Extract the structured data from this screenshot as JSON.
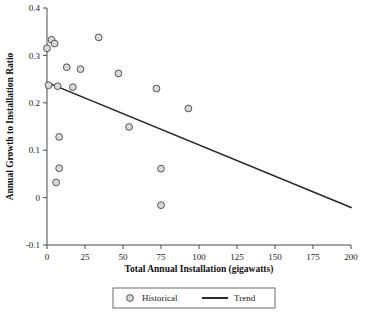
{
  "chart_data": {
    "type": "scatter",
    "title": "",
    "xlabel": "Total Annual Installation (gigawatts)",
    "ylabel": "Annual Growth to Installation Ratio",
    "xlim": [
      0,
      200
    ],
    "ylim": [
      -0.1,
      0.4
    ],
    "xticks": [
      0,
      25,
      50,
      75,
      100,
      125,
      150,
      175,
      200
    ],
    "xticklabels": [
      "0",
      "25",
      "50",
      "75",
      "100",
      "125",
      "150",
      "175",
      "200"
    ],
    "yticks": [
      -0.1,
      0,
      0.1,
      0.2,
      0.3,
      0.4
    ],
    "yticklabels": [
      "-0.1",
      "0",
      "0.1",
      "0.2",
      "0.3",
      "0.4"
    ],
    "grid": false,
    "legend_position": "below-center",
    "series": [
      {
        "name": "Historical",
        "type": "scatter",
        "marker": "circle-open",
        "marker_fill": "#d9d9d9",
        "marker_edge": "#555555",
        "points": [
          {
            "x": 0,
            "y": 0.315
          },
          {
            "x": 3,
            "y": 0.333
          },
          {
            "x": 5,
            "y": 0.325
          },
          {
            "x": 1,
            "y": 0.237
          },
          {
            "x": 7,
            "y": 0.235
          },
          {
            "x": 13,
            "y": 0.275
          },
          {
            "x": 22,
            "y": 0.271
          },
          {
            "x": 17,
            "y": 0.233
          },
          {
            "x": 34,
            "y": 0.338
          },
          {
            "x": 47,
            "y": 0.262
          },
          {
            "x": 72,
            "y": 0.23
          },
          {
            "x": 93,
            "y": 0.188
          },
          {
            "x": 54,
            "y": 0.149
          },
          {
            "x": 8,
            "y": 0.128
          },
          {
            "x": 8,
            "y": 0.062
          },
          {
            "x": 6,
            "y": 0.032
          },
          {
            "x": 75,
            "y": 0.061
          },
          {
            "x": 75,
            "y": -0.016
          }
        ]
      },
      {
        "name": "Trend",
        "type": "line",
        "color": "#2a2a2a",
        "endpoints": [
          {
            "x": 0,
            "y": 0.243
          },
          {
            "x": 200,
            "y": -0.021
          }
        ]
      }
    ]
  },
  "legend": {
    "historical_label": "Historical",
    "trend_label": "Trend"
  }
}
